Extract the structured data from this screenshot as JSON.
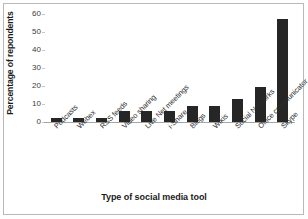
{
  "chart_data": {
    "type": "bar",
    "title": "",
    "xlabel": "Type of social media tool",
    "ylabel": "Percentage of repondents",
    "categories": [
      "Podcasts",
      "Webex",
      "RSS feeds",
      "Video sharing",
      "Live Net meetings",
      "i-Share",
      "Blogs",
      "Wikis",
      "Social Networks",
      "Office communicator",
      "Skype"
    ],
    "values": [
      2.5,
      2.5,
      2.5,
      6,
      6,
      6,
      9,
      9,
      13,
      19.5,
      57
    ],
    "ylim": [
      0,
      60
    ],
    "yticks": [
      0,
      10,
      20,
      30,
      40,
      50,
      60
    ],
    "ytick_labels": [
      "0",
      "10",
      "20",
      "30",
      "40",
      "50",
      "60"
    ],
    "grid": false,
    "legend": "none",
    "bar_color": "#262626",
    "axis_color": "#a6a6a6",
    "background": "#ffffff"
  }
}
